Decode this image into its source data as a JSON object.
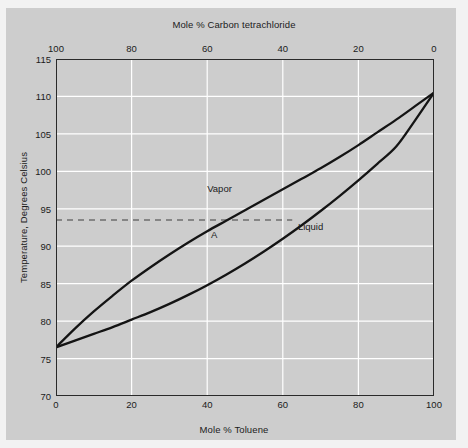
{
  "chart_data": {
    "type": "line",
    "title": "",
    "xlabel": "Mole % Toluene",
    "xlabel_top": "Mole % Carbon tetrachloride",
    "ylabel": "Temperature, Degrees Celsius",
    "xlim": [
      0,
      100
    ],
    "ylim": [
      70,
      115
    ],
    "xticks": [
      0,
      20,
      40,
      60,
      80,
      100
    ],
    "xticks_top": [
      100,
      80,
      60,
      40,
      20,
      0
    ],
    "yticks": [
      70,
      75,
      80,
      85,
      90,
      95,
      100,
      105,
      110,
      115
    ],
    "grid": true,
    "legend_position": "inline-annotation",
    "series": [
      {
        "name": "Vapor",
        "x": [
          0,
          5,
          10,
          15,
          20,
          25,
          30,
          35,
          40,
          45,
          50,
          55,
          60,
          65,
          70,
          75,
          80,
          85,
          90,
          95,
          100
        ],
        "y": [
          76.5,
          79.0,
          81.3,
          83.4,
          85.4,
          87.2,
          88.9,
          90.5,
          92.0,
          93.4,
          94.8,
          96.2,
          97.6,
          99.0,
          100.4,
          101.9,
          103.5,
          105.2,
          106.9,
          108.7,
          110.5
        ]
      },
      {
        "name": "Liquid",
        "x": [
          0,
          5,
          10,
          15,
          20,
          25,
          30,
          35,
          40,
          45,
          50,
          55,
          60,
          65,
          70,
          75,
          80,
          85,
          90,
          95,
          100
        ],
        "y": [
          76.5,
          77.4,
          78.3,
          79.2,
          80.2,
          81.2,
          82.3,
          83.5,
          84.8,
          86.2,
          87.7,
          89.3,
          91.0,
          92.8,
          94.7,
          96.7,
          98.8,
          101.0,
          103.3,
          106.8,
          110.5
        ]
      }
    ],
    "annotations": [
      {
        "label": "Vapor",
        "x": 40,
        "y": 97.5
      },
      {
        "label": "Liquid",
        "x": 64,
        "y": 92.4
      },
      {
        "label": "A",
        "x": 41,
        "y": 91.3
      }
    ],
    "tie_line": {
      "label": "tie-line",
      "temperature": 93.5,
      "x_start": 0,
      "x_end": 62.5,
      "style": "dashed"
    }
  },
  "colors": {
    "plate_background": "#cdcdcd",
    "page_background": "#f2f2f2",
    "grid": "#ffffff",
    "axis": "#2a2a2a",
    "curve": "#141414",
    "tie_line": "#6e6e6e",
    "text": "#1b1b1b"
  }
}
